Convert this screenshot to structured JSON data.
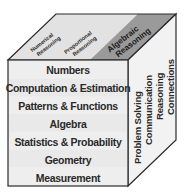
{
  "diagram": {
    "front_face": {
      "labels": [
        "Numbers",
        "Computation & Estimation",
        "Patterns & Functions",
        "Algebra",
        "Statistics & Probability",
        "Geometry",
        "Measurement"
      ]
    },
    "top_face": {
      "bands": [
        {
          "lines": [
            "Numerical",
            "Reasoning"
          ],
          "highlighted": false
        },
        {
          "lines": [
            "Proportional",
            "Reasoning"
          ],
          "highlighted": false
        },
        {
          "lines": [
            "Algebraic",
            "Reasoning"
          ],
          "highlighted": true
        }
      ]
    },
    "right_face": {
      "labels": [
        "Problem Solving",
        "Communication",
        "Reasoning",
        "Connections"
      ]
    },
    "colors": {
      "outline": "#2b2b2b",
      "front_fill": "#ececec",
      "top_fill": "#dcdcdc",
      "top_highlight": "#9a9a9a",
      "right_fill": "#f2f2f2",
      "text": "#2a2a2a"
    }
  }
}
